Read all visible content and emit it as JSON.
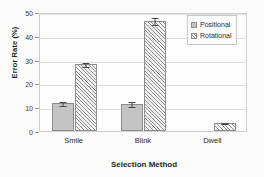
{
  "chart_data": {
    "type": "bar",
    "title": "",
    "xlabel": "Selection Method",
    "ylabel": "Error Rate (%)",
    "categories": [
      "Smile",
      "Blink",
      "Dwell"
    ],
    "series": [
      {
        "name": "Positional",
        "values": [
          11.6,
          11.2,
          null
        ],
        "errors": [
          1.0,
          1.3,
          null
        ],
        "fill": "solid-gray",
        "color": "#c4c4c4"
      },
      {
        "name": "Rotational",
        "values": [
          28.0,
          46.3,
          3.3
        ],
        "errors": [
          1.1,
          1.6,
          0.5
        ],
        "fill": "diagonal-hatch",
        "color": "#f2f2f2"
      }
    ],
    "ylim": [
      0,
      50
    ],
    "yticks": [
      0,
      10,
      20,
      30,
      40,
      50
    ],
    "ytick_labels": [
      "0",
      "10",
      "20",
      "30",
      "40",
      "50"
    ],
    "grid": true,
    "legend_position": "top-right",
    "legend_entries": [
      "Positional",
      "Rotational"
    ]
  },
  "legend": {
    "items": [
      {
        "label": "Positional"
      },
      {
        "label": "Rotational"
      }
    ]
  },
  "axes": {
    "y_title": "Error Rate (%)",
    "x_title": "Selection Method"
  }
}
